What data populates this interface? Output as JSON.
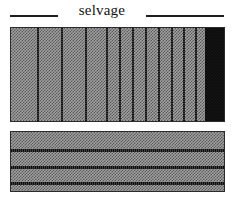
{
  "figure": {
    "name": "selvage-weaving-diagram",
    "background": "#ffffff",
    "width": 236,
    "height": 200
  },
  "caption": {
    "label": "selvage",
    "rule_color": "#1d1d1d",
    "left_rule": {
      "x": 10,
      "width": 48
    },
    "right_rule": {
      "x": 146,
      "width": 78
    }
  },
  "colors": {
    "weave_light": "#a0a0a0",
    "weave_dark": "#5a5a5a",
    "stripe_dark": "#1b1b1b",
    "selvage_black": "#0b0b0b",
    "panel_border": "#2b2b2b",
    "text": "#141414"
  },
  "panels": [
    {
      "name": "warp-swatch",
      "x": 10,
      "y": 27,
      "width": 215,
      "height": 95,
      "description": "woven ground with vertical warp stripes and dark selvage band at right edge"
    },
    {
      "name": "weft-swatch",
      "x": 10,
      "y": 131,
      "width": 215,
      "height": 61,
      "description": "woven ground with horizontal weft bands"
    }
  ],
  "warp_stripes": {
    "count": 14,
    "positions": [
      26,
      50,
      74,
      95,
      108,
      121,
      134,
      147,
      160,
      172,
      184,
      196
    ],
    "width": 2
  },
  "selvage_band": {
    "x": 194,
    "width": 19,
    "color": "#0b0b0b",
    "edge": "right"
  },
  "weft_bands": {
    "count": 3,
    "positions": [
      17,
      34,
      50
    ],
    "height": 3
  },
  "chart_data": {
    "type": "heatmap",
    "title": "selvage",
    "xlabel": "",
    "ylabel": "",
    "series": [
      {
        "name": "warp-swatch",
        "values": [
          26,
          50,
          74,
          95,
          108,
          121,
          134,
          147,
          160,
          172,
          184,
          196
        ]
      },
      {
        "name": "weft-swatch",
        "values": [
          17,
          34,
          50
        ]
      }
    ]
  }
}
